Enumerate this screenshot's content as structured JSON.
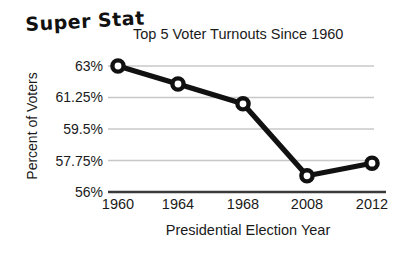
{
  "brand": {
    "label": "Super Stat"
  },
  "chart_data": {
    "type": "line",
    "title": "Top 5 Voter Turnouts Since 1960",
    "xlabel": "Presidential Election Year",
    "ylabel": "Percent of Voters",
    "categories": [
      "1960",
      "1964",
      "1968",
      "2008",
      "2012"
    ],
    "values": [
      63.0,
      62.0,
      60.9,
      56.9,
      57.6
    ],
    "ytick_labels": [
      "63%",
      "61.25%",
      "59.5%",
      "57.75%",
      "56%"
    ],
    "ytick_values": [
      63,
      61.25,
      59.5,
      57.75,
      56
    ],
    "ylim": [
      56,
      63
    ],
    "grid": true,
    "legend": "none",
    "line_color": "#111111",
    "marker_color": "#111111",
    "marker_fill": "#ffffff",
    "grid_color": "#c8c8c8",
    "axis_color": "#3a3a3a"
  }
}
